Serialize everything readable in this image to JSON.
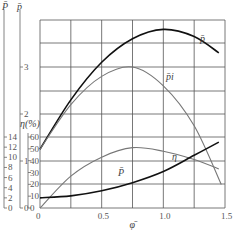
{
  "chart_data": {
    "type": "line",
    "title": "",
    "xlabel": "φ̄",
    "x_ticks": [
      "0",
      "0.5",
      "1.0",
      "1.5"
    ],
    "xlim": [
      0,
      1.5
    ],
    "axes": [
      {
        "name": "P̄ (left outer)",
        "label": "P̄",
        "ticks": [
          "0",
          "2",
          "4",
          "6",
          "8",
          "10",
          "12",
          "14"
        ]
      },
      {
        "name": "p̄",
        "label": "p̄",
        "ticks": [
          "0",
          "1",
          "2",
          "3"
        ]
      },
      {
        "name": "η (%)",
        "label": "η(%)",
        "ticks": [
          "0",
          "10",
          "20",
          "30",
          "40",
          "50",
          "60"
        ]
      }
    ],
    "grid": true,
    "series": [
      {
        "name": "p̄",
        "axis": "p̄",
        "color": "#111111",
        "x": [
          0,
          0.25,
          0.5,
          0.75,
          1.0,
          1.25,
          1.45
        ],
        "y": [
          1.25,
          2.3,
          3.1,
          3.6,
          3.8,
          3.65,
          3.3
        ]
      },
      {
        "name": "p̄_i",
        "axis": "p̄",
        "color": "#777777",
        "x": [
          0,
          0.25,
          0.5,
          0.75,
          1.0,
          1.25,
          1.47
        ],
        "y": [
          1.25,
          2.2,
          2.8,
          3.0,
          2.6,
          1.75,
          0.5
        ]
      },
      {
        "name": "η",
        "axis": "η (%)",
        "color": "#777777",
        "x": [
          0,
          0.25,
          0.5,
          0.75,
          1.0,
          1.25,
          1.45
        ],
        "y": [
          0,
          27,
          43,
          51,
          48,
          41,
          33
        ]
      },
      {
        "name": "P̄",
        "axis": "P̄ (left outer)",
        "color": "#111111",
        "x": [
          0,
          0.25,
          0.5,
          0.75,
          1.0,
          1.25,
          1.45
        ],
        "y": [
          2.0,
          2.4,
          3.4,
          5.0,
          7.2,
          10.4,
          13.0
        ]
      }
    ],
    "annotations": [
      "p̄",
      "p̄i",
      "η",
      "P̄"
    ]
  },
  "labels": {
    "axis_outer": "P̄",
    "axis_mid": "p̄",
    "axis_eta": "η(%)",
    "eta_two": "2",
    "x_axis": "φ̄",
    "curve_p": "p̄",
    "curve_pi": "p̄i",
    "curve_eta": "η",
    "curve_P": "P̄"
  }
}
